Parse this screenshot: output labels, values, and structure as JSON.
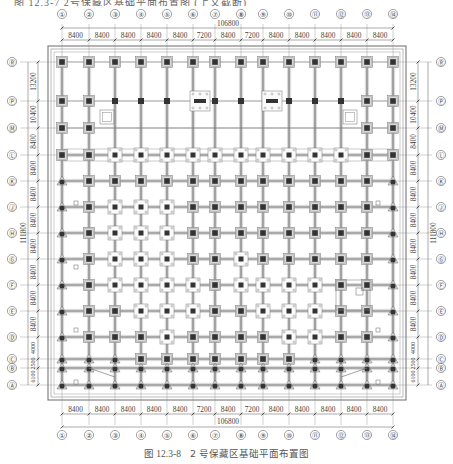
{
  "header_cut_text": "图 12.3-7 2号保藏区基础平面布置图 (上文截断)",
  "figure": {
    "caption_label": "图 12.3-8",
    "caption_title": "2 号保藏区基础平面布置图"
  },
  "plan": {
    "columns": {
      "labels": [
        "①",
        "②",
        "③",
        "④",
        "⑤",
        "⑥",
        "⑦",
        "⑧",
        "⑨",
        "⑩",
        "⑪",
        "⑫",
        "⑬",
        "⑭"
      ],
      "x": [
        62,
        89,
        115,
        141,
        167,
        193,
        215,
        241,
        263,
        289,
        315,
        341,
        367,
        393
      ],
      "spacings": [
        "8400",
        "8400",
        "8400",
        "8400",
        "8400",
        "7200",
        "8400",
        "7200",
        "8400",
        "8400",
        "8400",
        "8400",
        "8400"
      ],
      "total": "106800"
    },
    "rows": {
      "labels": [
        "Ⓡ",
        "Ⓟ",
        "Ⓜ",
        "Ⓛ",
        "Ⓚ",
        "Ⓙ",
        "Ⓗ",
        "Ⓖ",
        "Ⓕ",
        "Ⓔ",
        "Ⓓ",
        "Ⓒ",
        "Ⓑ",
        "Ⓐ"
      ],
      "y": [
        62,
        101,
        128,
        155,
        181,
        207,
        233,
        259,
        285,
        311,
        337,
        359,
        368,
        385
      ],
      "spacings": [
        "13200",
        "10400",
        "8400",
        "8400",
        "8400",
        "8400",
        "8400",
        "8400",
        "8400",
        "8400",
        "4000",
        "2500",
        "6100"
      ],
      "total": "111800"
    },
    "colors": {
      "line": "#555555",
      "light": "#9a9a9a",
      "cap_fill": "#d8d8d8",
      "column_fill": "#333333",
      "frame": "#777777"
    }
  }
}
